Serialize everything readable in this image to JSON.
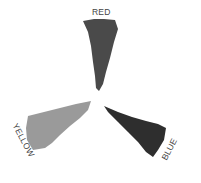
{
  "diagram": {
    "type": "color-wedges",
    "wedges": [
      {
        "name": "red",
        "label": "RED",
        "fill": "#4a4a4a"
      },
      {
        "name": "yellow",
        "label": "YELLOW",
        "fill": "#9a9a9a"
      },
      {
        "name": "blue",
        "label": "BLUE",
        "fill": "#2e2e2e"
      }
    ]
  }
}
